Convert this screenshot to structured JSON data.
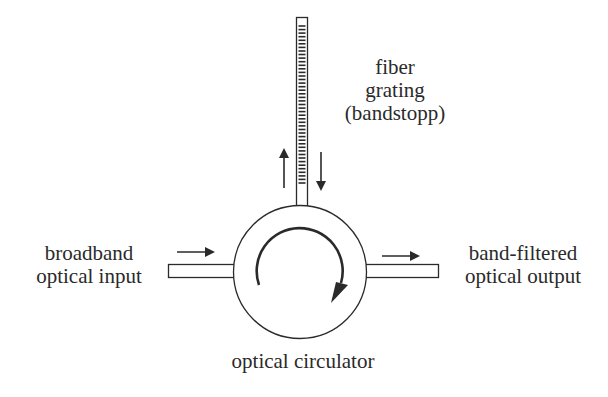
{
  "diagram": {
    "colors": {
      "stroke": "#2a2a2a",
      "background": "#ffffff"
    },
    "labels": {
      "input": {
        "line1": "broadband",
        "line2": "optical input"
      },
      "output": {
        "line1": "band-filtered",
        "line2": "optical output"
      },
      "grating": {
        "line1": "fiber",
        "line2": "grating",
        "line3": "(bandstopp)"
      },
      "circulator": {
        "line1": "optical circulator"
      }
    },
    "components": [
      {
        "id": "input-fiber",
        "type": "fiber"
      },
      {
        "id": "optical-circulator",
        "type": "circulator",
        "rotation": "clockwise"
      },
      {
        "id": "fiber-grating",
        "type": "fiber-bragg-grating",
        "tick_count": 45
      },
      {
        "id": "output-fiber",
        "type": "fiber"
      }
    ],
    "arrows": [
      {
        "id": "input-arrow",
        "direction": "right"
      },
      {
        "id": "grating-return-arrow",
        "direction": "up"
      },
      {
        "id": "grating-forward-arrow",
        "direction": "down"
      },
      {
        "id": "output-arrow",
        "direction": "right"
      }
    ]
  }
}
